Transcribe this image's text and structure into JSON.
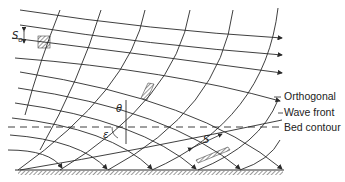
{
  "legend": {
    "orthogonal": "Orthogonal",
    "wave_front": "Wave front",
    "bed_contour": "Bed contour"
  },
  "symbols": {
    "theta": "θ",
    "epsilon": "ε",
    "s0": "S",
    "s0_sub": "o",
    "s": "S"
  },
  "colors": {
    "line": "#2a2a2a",
    "background": "#ffffff"
  }
}
